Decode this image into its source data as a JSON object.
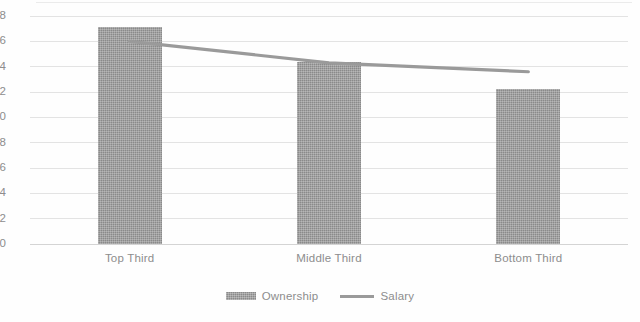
{
  "chart_data": {
    "type": "bar",
    "title": "",
    "subtitle": "",
    "xlabel": "",
    "ylabel": "",
    "categories": [
      "Top Third",
      "Middle Third",
      "Bottom Third"
    ],
    "ylim": [
      0,
      18
    ],
    "ytick_labels": [
      "0",
      "2",
      "4",
      "6",
      "8",
      "10",
      "12",
      "14",
      "16",
      "18"
    ],
    "ytick_values": [
      0,
      2,
      4,
      6,
      8,
      10,
      12,
      14,
      16,
      18
    ],
    "grid": true,
    "legend_position": "bottom-center",
    "series": [
      {
        "name": "Ownership",
        "type": "bar",
        "values": [
          17.1,
          14.4,
          12.2
        ],
        "color": "#8a8a8a"
      },
      {
        "name": "Salary",
        "type": "line",
        "values": [
          16.0,
          14.3,
          13.6
        ],
        "color": "#9a9a9a"
      }
    ]
  },
  "legend": {
    "items": [
      {
        "label": "Ownership",
        "marker": "bar-swatch"
      },
      {
        "label": "Salary",
        "marker": "line-swatch"
      }
    ]
  },
  "colors": {
    "bar_fill": "#8a8a8a",
    "line_stroke": "#9a9a9a",
    "gridline": "#d9d9d9",
    "tick_text": "#8d8d8d",
    "background": "#fefefe"
  }
}
